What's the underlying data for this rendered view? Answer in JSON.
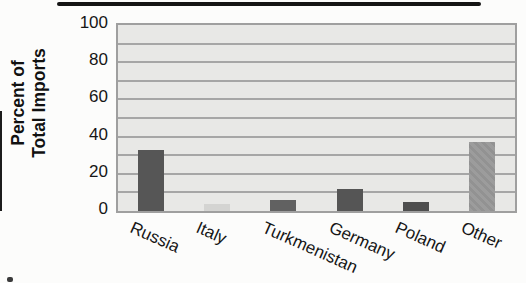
{
  "figure": {
    "kind": "scanned textbook bar chart",
    "background_color": "#fcfcfb",
    "top_rule_color": "#141414"
  },
  "chart_data": {
    "type": "bar",
    "title": "",
    "xlabel": "",
    "ylabel": "Percent of Total Imports",
    "ylabel_lines": [
      "Percent of",
      "Total Imports"
    ],
    "categories": [
      "Russia",
      "Italy",
      "Turkmenistan",
      "Germany",
      "Poland",
      "Other"
    ],
    "values": [
      33,
      4,
      6,
      12,
      5,
      37
    ],
    "bars": [
      {
        "category": "Russia",
        "value": 33,
        "color": "#565656",
        "pattern": "solid"
      },
      {
        "category": "Italy",
        "value": 4,
        "color": "#d4d4d2",
        "pattern": "solid"
      },
      {
        "category": "Turkmenistan",
        "value": 6,
        "color": "#616161",
        "pattern": "solid"
      },
      {
        "category": "Germany",
        "value": 12,
        "color": "#555555",
        "pattern": "solid"
      },
      {
        "category": "Poland",
        "value": 5,
        "color": "#4e4e4e",
        "pattern": "solid"
      },
      {
        "category": "Other",
        "value": 37,
        "color": "#9c9c9c",
        "pattern": "diagonal-hatch",
        "pattern_alt_color": "#929292"
      }
    ],
    "y_ticks": [
      0,
      20,
      40,
      60,
      80,
      100
    ],
    "ylim": [
      0,
      100
    ],
    "grid": "horizontal, every 10 units",
    "grid_step": 10,
    "grid_color": "#a6a6a6",
    "plot_bg_color": "#e8e8e6",
    "plot_border_color": "#9f9f9f",
    "legend": "none",
    "x_tick_label_rotation_deg": -24
  }
}
